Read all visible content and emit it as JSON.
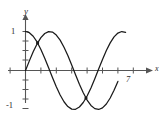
{
  "figure": {
    "kind": "math-graph",
    "background_color": "#ffffff",
    "stroke_color": "#1a1a1a",
    "axis_color": "#555555",
    "labels": {
      "y_axis": "y",
      "x_axis": "x",
      "y_top_tick": "1",
      "y_bottom_tick": "-1",
      "x_tick_seven": "7"
    }
  },
  "chart_data": {
    "type": "line",
    "title": "",
    "xlabel": "x",
    "ylabel": "y",
    "xlim": [
      -0.6,
      8.0
    ],
    "ylim": [
      -1.45,
      1.35
    ],
    "grid": false,
    "legend": false,
    "x_ticks": [
      1,
      2,
      3,
      4,
      5,
      6,
      7
    ],
    "x_tick_labels": [
      "",
      "",
      "",
      "",
      "",
      "",
      "7"
    ],
    "y_ticks": [
      -1,
      1
    ],
    "y_tick_labels": [
      "-1",
      "1"
    ],
    "series": [
      {
        "name": "cosine-curve",
        "expression": "y = cos(x)",
        "color": "#1a1a1a",
        "x": [
          0.0,
          0.25,
          0.5,
          0.75,
          1.0,
          1.25,
          1.5,
          1.75,
          2.0,
          2.25,
          2.5,
          2.75,
          3.0,
          3.25,
          3.5,
          3.75,
          4.0,
          4.25,
          4.5,
          4.75,
          5.0,
          5.25,
          5.5,
          5.75,
          6.0,
          6.25,
          6.5
        ],
        "y": [
          1.0,
          0.969,
          0.878,
          0.732,
          0.54,
          0.315,
          0.071,
          -0.178,
          -0.416,
          -0.628,
          -0.801,
          -0.924,
          -0.99,
          -0.994,
          -0.936,
          -0.821,
          -0.654,
          -0.447,
          -0.211,
          0.038,
          0.284,
          0.512,
          0.709,
          0.863,
          0.96,
          0.999,
          0.977
        ]
      },
      {
        "name": "sine-curve",
        "expression": "y = sin(x)",
        "color": "#1a1a1a",
        "x": [
          0.0,
          0.25,
          0.5,
          0.75,
          1.0,
          1.25,
          1.5,
          1.75,
          2.0,
          2.25,
          2.5,
          2.75,
          3.0,
          3.25,
          3.5,
          3.75,
          4.0,
          4.25,
          4.5,
          4.75,
          5.0,
          5.25,
          5.5,
          5.75,
          6.0
        ],
        "y": [
          0.0,
          0.247,
          0.479,
          0.682,
          0.841,
          0.949,
          0.997,
          0.984,
          0.909,
          0.778,
          0.598,
          0.382,
          0.141,
          -0.108,
          -0.351,
          -0.572,
          -0.757,
          -0.895,
          -0.978,
          -0.999,
          -0.959,
          -0.859,
          -0.706,
          -0.506,
          -0.279
        ]
      }
    ],
    "marked_intersections": [
      {
        "x": 0.785,
        "y": 0.707
      },
      {
        "x": 3.927,
        "y": -0.707
      }
    ]
  }
}
